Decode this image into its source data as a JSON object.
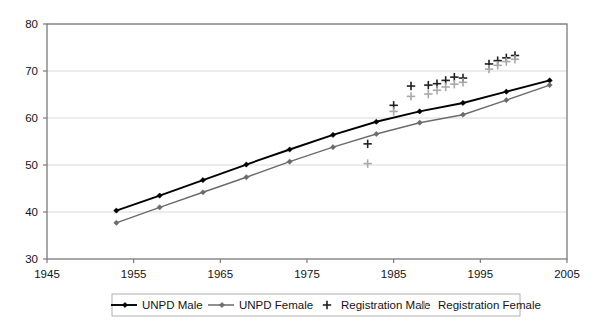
{
  "chart_data": {
    "type": "line",
    "title": "",
    "subtitle": "",
    "xlabel": "",
    "ylabel": "",
    "xlim": [
      1945,
      2005
    ],
    "ylim": [
      30,
      80
    ],
    "xticks": [
      1945,
      1955,
      1965,
      1975,
      1985,
      1995,
      2005
    ],
    "yticks": [
      30,
      40,
      50,
      60,
      70,
      80
    ],
    "grid": "horizontal",
    "legend_position": "bottom",
    "series": [
      {
        "name": "UNPD Male",
        "type": "line",
        "color": "#000000",
        "marker": "diamond",
        "x": [
          1953,
          1958,
          1963,
          1968,
          1973,
          1978,
          1983,
          1988,
          1993,
          1998,
          2003
        ],
        "values": [
          40.3,
          43.5,
          46.8,
          50.1,
          53.3,
          56.4,
          59.2,
          61.4,
          63.2,
          65.6,
          68.0
        ]
      },
      {
        "name": "UNPD Female",
        "type": "line",
        "color": "#6b6b6b",
        "marker": "diamond",
        "x": [
          1953,
          1958,
          1963,
          1968,
          1973,
          1978,
          1983,
          1988,
          1993,
          1998,
          2003
        ],
        "values": [
          37.7,
          41.0,
          44.2,
          47.4,
          50.7,
          53.8,
          56.6,
          59.0,
          60.7,
          63.8,
          67.0
        ]
      },
      {
        "name": "Registration Male",
        "type": "scatter",
        "color": "#202020",
        "marker": "plus",
        "x": [
          1982,
          1985,
          1987,
          1989,
          1990,
          1991,
          1992,
          1993,
          1996,
          1997,
          1998,
          1999
        ],
        "values": [
          54.5,
          62.7,
          66.8,
          67.0,
          67.3,
          68.0,
          68.7,
          68.5,
          71.5,
          72.2,
          72.8,
          73.3
        ]
      },
      {
        "name": "Registration Female",
        "type": "scatter",
        "color": "#a8a8a8",
        "marker": "plus",
        "x": [
          1982,
          1985,
          1987,
          1989,
          1990,
          1991,
          1992,
          1993,
          1996,
          1997,
          1998,
          1999
        ],
        "values": [
          50.3,
          61.4,
          64.6,
          65.1,
          65.9,
          66.6,
          67.2,
          67.6,
          70.4,
          71.2,
          72.0,
          72.5
        ]
      }
    ]
  },
  "axes": {
    "y_tick_labels": [
      "80",
      "70",
      "60",
      "50",
      "40",
      "30"
    ],
    "x_tick_labels": [
      "1945",
      "1955",
      "1965",
      "1975",
      "1985",
      "1995",
      "2005"
    ]
  },
  "legend": {
    "items": [
      {
        "label": "UNPD Male",
        "marker": "line-diamond",
        "color": "#000000"
      },
      {
        "label": "UNPD Female",
        "marker": "line-diamond",
        "color": "#6b6b6b"
      },
      {
        "label": "Registration Male",
        "marker": "plus",
        "color": "#202020"
      },
      {
        "label": "Registration Female",
        "marker": "plus",
        "color": "#a8a8a8"
      }
    ]
  },
  "colors": {
    "plot_border": "#7a7a7a",
    "gridline": "#d9d9d9",
    "background": "#ffffff",
    "text": "#141414"
  }
}
